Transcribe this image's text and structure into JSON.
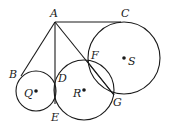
{
  "diagram": {
    "type": "geometry",
    "stroke_color": "#1a1a1a",
    "background": "#ffffff",
    "points": {
      "A": {
        "label": "A",
        "x": 55,
        "y": 22,
        "lx": 50,
        "ly": 17
      },
      "B": {
        "label": "B",
        "x": 21,
        "y": 76,
        "lx": 9,
        "ly": 78
      },
      "C": {
        "label": "C",
        "x": 121,
        "y": 22,
        "lx": 121,
        "ly": 17
      },
      "D": {
        "label": "D",
        "x": 55,
        "y": 80,
        "lx": 58,
        "ly": 82
      },
      "E": {
        "label": "E",
        "x": 55,
        "y": 104,
        "lx": 51,
        "ly": 121
      },
      "F": {
        "label": "F",
        "x": 87,
        "y": 61,
        "lx": 91,
        "ly": 59
      },
      "G": {
        "label": "G",
        "x": 114,
        "y": 95,
        "lx": 113,
        "ly": 106
      },
      "Q": {
        "label": "Q",
        "x": 36,
        "y": 91,
        "lx": 24,
        "ly": 97
      },
      "R": {
        "label": "R",
        "x": 84,
        "y": 90,
        "lx": 73,
        "ly": 97
      },
      "S": {
        "label": "S",
        "x": 124,
        "y": 58,
        "lx": 128,
        "ly": 65
      }
    },
    "circles": [
      {
        "name": "circle-Q",
        "center": "Q",
        "cx": 36,
        "cy": 91,
        "r": 20
      },
      {
        "name": "circle-R",
        "center": "R",
        "cx": 84,
        "cy": 90,
        "r": 30
      },
      {
        "name": "circle-S",
        "center": "S",
        "cx": 124,
        "cy": 58,
        "r": 36
      }
    ],
    "segments": [
      {
        "name": "segment-AB",
        "from": "A",
        "to": "B"
      },
      {
        "name": "segment-AC",
        "from": "A",
        "to": "C"
      },
      {
        "name": "segment-AE",
        "from": "A",
        "to": "E"
      },
      {
        "name": "segment-AG",
        "from": "A",
        "to": "G"
      },
      {
        "name": "segment-FG",
        "from": "F",
        "to": "G"
      }
    ]
  }
}
